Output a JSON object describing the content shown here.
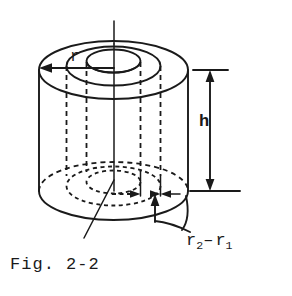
{
  "figure": {
    "caption": "Fig. 2-2",
    "background_color": "#ffffff",
    "line_color": "#1a1a1a"
  },
  "labels": {
    "radius": "r",
    "height": "h",
    "thickness_base": "r",
    "thickness_sub_outer": "2",
    "thickness_minus": "–",
    "thickness_sub_inner": "1",
    "thickness_full": "r2 - r1"
  },
  "annotations": {
    "radius_arrow": "radius dimension arrow pointing left from axis to outer rim",
    "height_arrow": "vertical double headed arrow between top and bottom extension lines",
    "thickness_arrows": "opposing horizontal arrowheads spanning the annular wall thickness",
    "leader": "curved leader from thickness label to wall callout arrow"
  }
}
